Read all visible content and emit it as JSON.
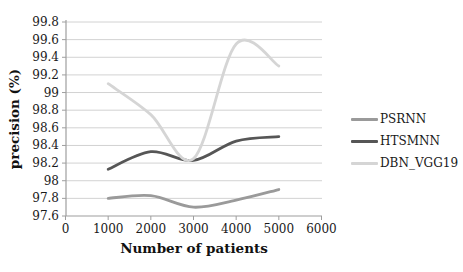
{
  "chart_data": {
    "type": "line",
    "title": "",
    "xlabel": "Number of patients",
    "ylabel": "precision (%)",
    "x": [
      1000,
      2000,
      3000,
      4000,
      5000
    ],
    "x_ticks": [
      0,
      1000,
      2000,
      3000,
      4000,
      5000,
      6000
    ],
    "xlim": [
      0,
      6000
    ],
    "ylim": [
      97.6,
      99.8
    ],
    "y_tick_step": 0.2,
    "grid": "horizontal",
    "line_smoothing": true,
    "legend_position": "right",
    "series": [
      {
        "name": "PSRNN",
        "color": "#9a9a9a",
        "values": [
          97.8,
          97.83,
          97.7,
          97.78,
          97.9
        ]
      },
      {
        "name": "HTSMNN",
        "color": "#565656",
        "values": [
          98.13,
          98.33,
          98.23,
          98.45,
          98.5
        ]
      },
      {
        "name": "DBN_VGG19",
        "color": "#d5d5d5",
        "values": [
          99.1,
          98.75,
          98.25,
          99.55,
          99.3
        ]
      }
    ],
    "colors": {
      "gridline": "#d2d2d2",
      "axis": "#9e9e9e",
      "text": "#1a1a1a",
      "background": "#ffffff"
    }
  }
}
